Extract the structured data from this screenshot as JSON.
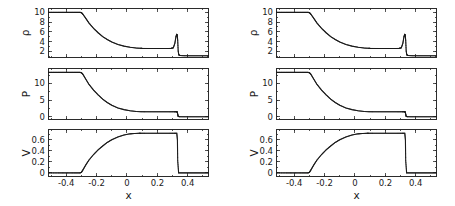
{
  "figure": {
    "title": "",
    "panel_count": 2,
    "note": "Two side-by-side identical multi-panel shock-tube (Riemann problem) plots"
  },
  "axis_labels": {
    "rho": "ρ",
    "P": "P",
    "V": "V",
    "x": "x"
  },
  "ticks": {
    "rho_major": [
      "2",
      "4",
      "6",
      "8",
      "10"
    ],
    "rho_major_values": [
      2,
      4,
      6,
      8,
      10
    ],
    "P_major": [
      "0",
      "5",
      "10"
    ],
    "P_major_values": [
      0,
      5,
      10
    ],
    "V_major": [
      "0",
      "0.2",
      "0.4",
      "0.6"
    ],
    "V_major_values": [
      0,
      0.2,
      0.4,
      0.6
    ],
    "x_major": [
      "-0.4",
      "-0.2",
      "0",
      "0.2",
      "0.4"
    ],
    "x_major_values": [
      -0.4,
      -0.2,
      0,
      0.2,
      0.4
    ]
  },
  "chart_data": [
    {
      "type": "line",
      "id": "left-density",
      "title": "",
      "xlabel": "",
      "ylabel": "ρ",
      "xlim": [
        -0.52,
        0.54
      ],
      "ylim": [
        0.6,
        10.9
      ],
      "grid": false,
      "legend": "none",
      "categories": [],
      "x": [
        -0.52,
        -0.45,
        -0.4,
        -0.35,
        -0.31,
        -0.3,
        -0.29,
        -0.27,
        -0.25,
        -0.22,
        -0.19,
        -0.16,
        -0.13,
        -0.1,
        -0.06,
        -0.02,
        0.02,
        0.06,
        0.09,
        0.1,
        0.14,
        0.18,
        0.22,
        0.26,
        0.29,
        0.305,
        0.315,
        0.322,
        0.327,
        0.331,
        0.334,
        0.337,
        0.341,
        0.35,
        0.38,
        0.42,
        0.46,
        0.5,
        0.54
      ],
      "values": [
        10.0,
        10.0,
        10.0,
        10.0,
        10.0,
        9.95,
        9.6,
        8.7,
        7.8,
        6.7,
        5.8,
        5.0,
        4.4,
        3.9,
        3.4,
        3.05,
        2.82,
        2.66,
        2.6,
        2.58,
        2.57,
        2.56,
        2.56,
        2.56,
        2.58,
        2.7,
        3.6,
        4.9,
        5.45,
        5.3,
        4.2,
        2.1,
        1.25,
        1.1,
        1.07,
        1.05,
        1.05,
        1.05,
        1.05
      ],
      "description": "Density: left state 10 falls through rarefaction to plateau 2.56, compresses to a contact/shock spike of ~5.5 near x=0.32, then drops to right state ~1"
    },
    {
      "type": "line",
      "id": "left-pressure",
      "title": "",
      "xlabel": "",
      "ylabel": "P",
      "xlim": [
        -0.52,
        0.54
      ],
      "ylim": [
        -0.9,
        14.6
      ],
      "grid": false,
      "legend": "none",
      "categories": [],
      "x": [
        -0.52,
        -0.45,
        -0.4,
        -0.35,
        -0.31,
        -0.3,
        -0.29,
        -0.27,
        -0.25,
        -0.22,
        -0.19,
        -0.16,
        -0.13,
        -0.1,
        -0.06,
        -0.02,
        0.02,
        0.06,
        0.09,
        0.12,
        0.16,
        0.2,
        0.24,
        0.28,
        0.31,
        0.325,
        0.331,
        0.334,
        0.337,
        0.345,
        0.38,
        0.42,
        0.46,
        0.5,
        0.54
      ],
      "values": [
        13.3,
        13.3,
        13.3,
        13.3,
        13.3,
        13.2,
        12.7,
        11.2,
        9.7,
        8.0,
        6.6,
        5.3,
        4.3,
        3.5,
        2.7,
        2.2,
        1.85,
        1.65,
        1.58,
        1.55,
        1.54,
        1.54,
        1.54,
        1.54,
        1.55,
        1.56,
        1.5,
        0.8,
        0.18,
        0.08,
        0.06,
        0.06,
        0.06,
        0.06,
        0.06
      ],
      "description": "Pressure: left state 13.3 falls through rarefaction to plateau ~1.55, then drops to near 0 across the shock at x=0.333"
    },
    {
      "type": "line",
      "id": "left-velocity",
      "title": "",
      "xlabel": "x",
      "ylabel": "V",
      "xlim": [
        -0.52,
        0.54
      ],
      "ylim": [
        -0.075,
        0.8
      ],
      "grid": false,
      "legend": "none",
      "categories": [],
      "x": [
        -0.52,
        -0.45,
        -0.4,
        -0.35,
        -0.31,
        -0.3,
        -0.29,
        -0.27,
        -0.25,
        -0.22,
        -0.19,
        -0.16,
        -0.13,
        -0.1,
        -0.06,
        -0.02,
        0.02,
        0.05,
        0.08,
        0.09,
        0.12,
        0.16,
        0.2,
        0.24,
        0.28,
        0.31,
        0.328,
        0.332,
        0.334,
        0.34,
        0.38,
        0.42,
        0.46,
        0.5,
        0.54
      ],
      "values": [
        0.0,
        0.0,
        0.0,
        0.0,
        0.0,
        0.01,
        0.055,
        0.15,
        0.235,
        0.335,
        0.42,
        0.49,
        0.555,
        0.605,
        0.655,
        0.69,
        0.712,
        0.718,
        0.722,
        0.722,
        0.722,
        0.722,
        0.722,
        0.722,
        0.722,
        0.722,
        0.722,
        0.6,
        0.22,
        0.0,
        0.0,
        0.0,
        0.0,
        0.0,
        0.0
      ],
      "description": "Velocity: zero left state rises through rarefaction to plateau ~0.72, then falls vertically to zero at the shock x=0.333"
    },
    {
      "type": "line",
      "id": "right-density",
      "title": "",
      "xlabel": "",
      "ylabel": "ρ",
      "xlim": [
        -0.52,
        0.54
      ],
      "ylim": [
        0.6,
        10.9
      ],
      "grid": false,
      "legend": "none",
      "categories": [],
      "x": [
        -0.52,
        -0.45,
        -0.4,
        -0.35,
        -0.31,
        -0.3,
        -0.29,
        -0.27,
        -0.25,
        -0.22,
        -0.19,
        -0.16,
        -0.13,
        -0.1,
        -0.06,
        -0.02,
        0.02,
        0.06,
        0.09,
        0.1,
        0.14,
        0.18,
        0.22,
        0.26,
        0.29,
        0.305,
        0.315,
        0.322,
        0.327,
        0.331,
        0.334,
        0.337,
        0.341,
        0.35,
        0.38,
        0.42,
        0.46,
        0.5,
        0.54
      ],
      "values": [
        10.0,
        10.0,
        10.0,
        10.0,
        10.0,
        9.95,
        9.6,
        8.7,
        7.8,
        6.7,
        5.8,
        5.0,
        4.4,
        3.9,
        3.4,
        3.05,
        2.82,
        2.66,
        2.6,
        2.58,
        2.57,
        2.56,
        2.56,
        2.56,
        2.58,
        2.7,
        3.6,
        4.9,
        5.45,
        5.3,
        4.2,
        2.1,
        1.25,
        1.1,
        1.07,
        1.05,
        1.05,
        1.05,
        1.05
      ],
      "description": "Density, right figure: identical profile to the left figure"
    },
    {
      "type": "line",
      "id": "right-pressure",
      "title": "",
      "xlabel": "",
      "ylabel": "P",
      "xlim": [
        -0.52,
        0.54
      ],
      "ylim": [
        -0.9,
        14.6
      ],
      "grid": false,
      "legend": "none",
      "categories": [],
      "x": [
        -0.52,
        -0.45,
        -0.4,
        -0.35,
        -0.31,
        -0.3,
        -0.29,
        -0.27,
        -0.25,
        -0.22,
        -0.19,
        -0.16,
        -0.13,
        -0.1,
        -0.06,
        -0.02,
        0.02,
        0.06,
        0.09,
        0.12,
        0.16,
        0.2,
        0.24,
        0.28,
        0.31,
        0.325,
        0.331,
        0.334,
        0.337,
        0.345,
        0.38,
        0.42,
        0.46,
        0.5,
        0.54
      ],
      "values": [
        13.3,
        13.3,
        13.3,
        13.3,
        13.3,
        13.2,
        12.7,
        11.2,
        9.7,
        8.0,
        6.6,
        5.3,
        4.3,
        3.5,
        2.7,
        2.2,
        1.85,
        1.65,
        1.58,
        1.55,
        1.54,
        1.54,
        1.54,
        1.54,
        1.55,
        1.56,
        1.5,
        0.8,
        0.18,
        0.08,
        0.06,
        0.06,
        0.06,
        0.06,
        0.06
      ],
      "description": "Pressure, right figure: identical profile to the left figure"
    },
    {
      "type": "line",
      "id": "right-velocity",
      "title": "",
      "xlabel": "x",
      "ylabel": "V",
      "xlim": [
        -0.52,
        0.54
      ],
      "ylim": [
        -0.075,
        0.8
      ],
      "grid": false,
      "legend": "none",
      "categories": [],
      "x": [
        -0.52,
        -0.45,
        -0.4,
        -0.35,
        -0.31,
        -0.3,
        -0.29,
        -0.27,
        -0.25,
        -0.22,
        -0.19,
        -0.16,
        -0.13,
        -0.1,
        -0.06,
        -0.02,
        0.02,
        0.05,
        0.08,
        0.09,
        0.12,
        0.16,
        0.2,
        0.24,
        0.28,
        0.31,
        0.328,
        0.332,
        0.334,
        0.34,
        0.38,
        0.42,
        0.46,
        0.5,
        0.54
      ],
      "values": [
        0.0,
        0.0,
        0.0,
        0.0,
        0.0,
        0.01,
        0.055,
        0.15,
        0.235,
        0.335,
        0.42,
        0.49,
        0.555,
        0.605,
        0.655,
        0.69,
        0.712,
        0.718,
        0.722,
        0.722,
        0.722,
        0.722,
        0.722,
        0.722,
        0.722,
        0.722,
        0.722,
        0.6,
        0.22,
        0.0,
        0.0,
        0.0,
        0.0,
        0.0,
        0.0
      ],
      "description": "Velocity, right figure: identical profile to the left figure"
    }
  ],
  "style": {
    "curve_color": "#1a1a1a",
    "frame_color": "#2b2b2b",
    "background": "#ffffff"
  }
}
